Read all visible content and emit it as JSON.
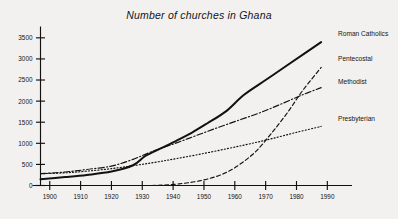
{
  "chart_data": {
    "type": "line",
    "title": "Number of churches in Ghana",
    "xlabel": "",
    "ylabel": "",
    "xlim": [
      1897,
      1992
    ],
    "ylim": [
      0,
      3650
    ],
    "grid": false,
    "legend_position": "right-of-line-ends",
    "x_ticks": [
      1900,
      1910,
      1920,
      1930,
      1940,
      1950,
      1960,
      1970,
      1980,
      1990
    ],
    "y_ticks": [
      0,
      500,
      1000,
      1500,
      2000,
      2500,
      3000,
      3500
    ],
    "x_tick_labels": [
      "1900",
      "1910",
      "1920",
      "1930",
      "1940",
      "1950",
      "1960",
      "1970",
      "1980",
      "1990"
    ],
    "y_tick_labels": [
      "0",
      "500",
      "1000",
      "1500",
      "2000",
      "2500",
      "3000",
      "3500"
    ],
    "series": [
      {
        "name": "Roman Catholics",
        "style": "solid",
        "stroke_width": 2.0,
        "label": "Roman Catholics",
        "x": [
          1897,
          1905,
          1912,
          1920,
          1927,
          1931,
          1936,
          1941,
          1946,
          1951,
          1957,
          1963,
          1970,
          1977,
          1983,
          1988
        ],
        "values": [
          150,
          200,
          250,
          330,
          480,
          700,
          880,
          1060,
          1250,
          1470,
          1750,
          2150,
          2500,
          2850,
          3150,
          3400
        ]
      },
      {
        "name": "Pentecostal",
        "style": "dashed",
        "stroke_width": 1.15,
        "label": "Pentecostal",
        "x": [
          1933,
          1937,
          1942,
          1947,
          1952,
          1957,
          1962,
          1967,
          1972,
          1977,
          1982,
          1988
        ],
        "values": [
          0,
          10,
          40,
          90,
          170,
          300,
          520,
          820,
          1250,
          1720,
          2250,
          2800
        ]
      },
      {
        "name": "Methodist",
        "style": "dashdot",
        "stroke_width": 1.15,
        "label": "Methodist",
        "x": [
          1897,
          1905,
          1912,
          1920,
          1927,
          1933,
          1940,
          1947,
          1954,
          1961,
          1968,
          1975,
          1982,
          1988
        ],
        "values": [
          280,
          320,
          380,
          460,
          620,
          800,
          980,
          1170,
          1360,
          1540,
          1720,
          1930,
          2150,
          2320
        ]
      },
      {
        "name": "Presbyterian",
        "style": "dotted",
        "stroke_width": 1.15,
        "label": "Presbyterian",
        "x": [
          1897,
          1905,
          1912,
          1920,
          1928,
          1935,
          1942,
          1950,
          1958,
          1965,
          1972,
          1980,
          1988
        ],
        "values": [
          280,
          300,
          340,
          400,
          480,
          560,
          650,
          760,
          880,
          990,
          1110,
          1260,
          1400
        ]
      }
    ]
  }
}
